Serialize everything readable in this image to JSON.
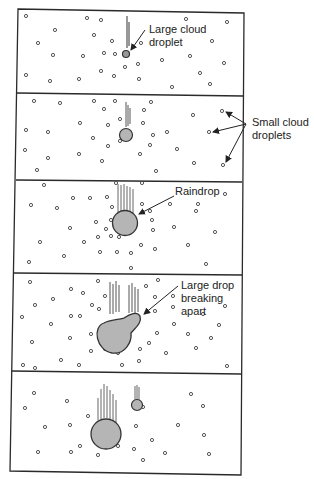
{
  "diagram": {
    "colors": {
      "border": "#2a2a2a",
      "drop_fill": "#b5b5b5",
      "droplet_stroke": "#444444",
      "text": "#222222"
    },
    "panels": [
      {
        "id": 1,
        "label_lines": [
          "Large cloud",
          "droplet"
        ],
        "stage": "large-cloud-droplet"
      },
      {
        "id": 2,
        "label_lines": [
          "Small cloud",
          "droplets"
        ],
        "stage": "growing-droplet"
      },
      {
        "id": 3,
        "label_lines": [
          "Raindrop"
        ],
        "stage": "raindrop"
      },
      {
        "id": 4,
        "label_lines": [
          "Large drop",
          "breaking",
          "apart"
        ],
        "stage": "breaking-apart"
      },
      {
        "id": 5,
        "label_lines": [],
        "stage": "two-drops"
      }
    ]
  }
}
